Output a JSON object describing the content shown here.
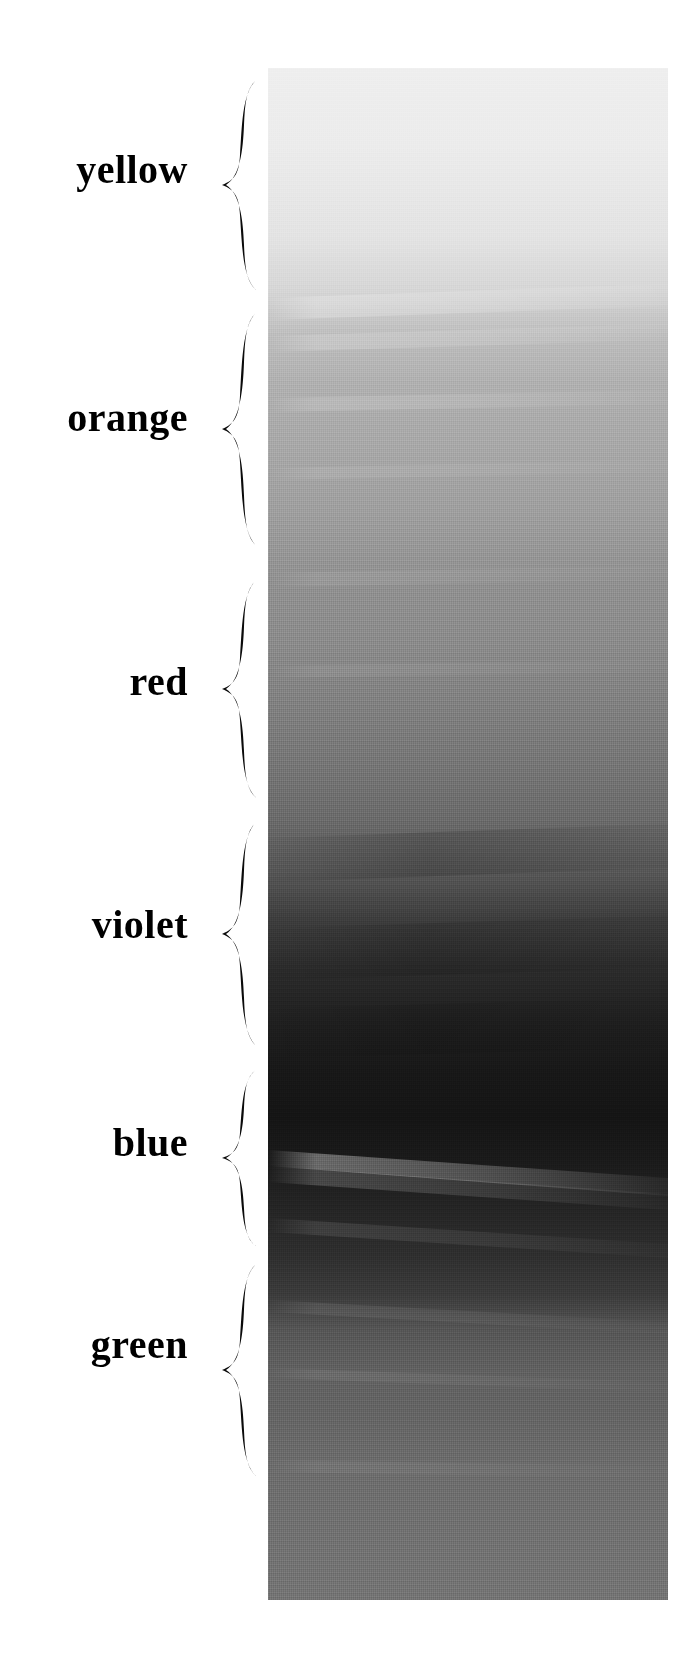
{
  "figure": {
    "title": "",
    "background_color": "#ffffff",
    "labels": [
      {
        "text": "yellow",
        "center_y": 170
      },
      {
        "text": "orange",
        "center_y": 418
      },
      {
        "text": "red",
        "center_y": 682
      },
      {
        "text": "violet",
        "center_y": 925
      },
      {
        "text": "blue",
        "center_y": 1143
      },
      {
        "text": "green",
        "center_y": 1345
      }
    ],
    "braces": [
      {
        "name": "yellow",
        "top": 78,
        "bottom": 292
      },
      {
        "name": "orange",
        "top": 310,
        "bottom": 548
      },
      {
        "name": "red",
        "top": 578,
        "bottom": 800
      },
      {
        "name": "violet",
        "top": 820,
        "bottom": 1048
      },
      {
        "name": "blue",
        "top": 1068,
        "bottom": 1248
      },
      {
        "name": "green",
        "top": 1262,
        "bottom": 1478
      }
    ],
    "strip": {
      "left": 268,
      "top": 68,
      "width": 400,
      "height": 1532,
      "description": "vertical grayscale painted gradient swatch with horizontal brushstroke texture",
      "gradient_stops": [
        {
          "pos": 0.0,
          "color": "#efefef"
        },
        {
          "pos": 0.05,
          "color": "#ececec"
        },
        {
          "pos": 0.11,
          "color": "#e4e4e4"
        },
        {
          "pos": 0.145,
          "color": "#d6d6d6"
        },
        {
          "pos": 0.175,
          "color": "#bdbdbd"
        },
        {
          "pos": 0.205,
          "color": "#b0b0b0"
        },
        {
          "pos": 0.245,
          "color": "#a8a8a8"
        },
        {
          "pos": 0.29,
          "color": "#9e9e9e"
        },
        {
          "pos": 0.335,
          "color": "#909090"
        },
        {
          "pos": 0.375,
          "color": "#8a8a8a"
        },
        {
          "pos": 0.41,
          "color": "#818181"
        },
        {
          "pos": 0.45,
          "color": "#767676"
        },
        {
          "pos": 0.49,
          "color": "#6a6a6a"
        },
        {
          "pos": 0.525,
          "color": "#565656"
        },
        {
          "pos": 0.555,
          "color": "#3d3d3d"
        },
        {
          "pos": 0.59,
          "color": "#2a2a2a"
        },
        {
          "pos": 0.625,
          "color": "#1e1e1e"
        },
        {
          "pos": 0.655,
          "color": "#171717"
        },
        {
          "pos": 0.685,
          "color": "#141414"
        },
        {
          "pos": 0.715,
          "color": "#1a1a1a"
        },
        {
          "pos": 0.745,
          "color": "#242424"
        },
        {
          "pos": 0.775,
          "color": "#2e2e2e"
        },
        {
          "pos": 0.8,
          "color": "#3a3a3a"
        },
        {
          "pos": 0.825,
          "color": "#565656"
        },
        {
          "pos": 0.85,
          "color": "#606060"
        },
        {
          "pos": 0.875,
          "color": "#636363"
        },
        {
          "pos": 0.905,
          "color": "#6a6a6a"
        },
        {
          "pos": 0.935,
          "color": "#6e6e6e"
        },
        {
          "pos": 0.965,
          "color": "#717171"
        },
        {
          "pos": 1.0,
          "color": "#737373"
        }
      ]
    }
  },
  "chart_data": {
    "type": "heatmap",
    "title": "",
    "xlabel": "",
    "ylabel": "",
    "orientation": "vertical",
    "categories": [
      "yellow",
      "orange",
      "red",
      "violet",
      "blue",
      "green"
    ],
    "values": [
      236,
      170,
      122,
      22,
      92,
      113
    ],
    "value_units": "grayscale luminance (0-255)",
    "band_ranges_px": [
      {
        "name": "yellow",
        "top": 68,
        "bottom": 296
      },
      {
        "name": "orange",
        "top": 296,
        "bottom": 556
      },
      {
        "name": "red",
        "top": 556,
        "bottom": 806
      },
      {
        "name": "violet",
        "top": 806,
        "bottom": 1054
      },
      {
        "name": "blue",
        "top": 1054,
        "bottom": 1254
      },
      {
        "name": "green",
        "top": 1254,
        "bottom": 1600
      }
    ],
    "legend": [],
    "grid": false
  }
}
